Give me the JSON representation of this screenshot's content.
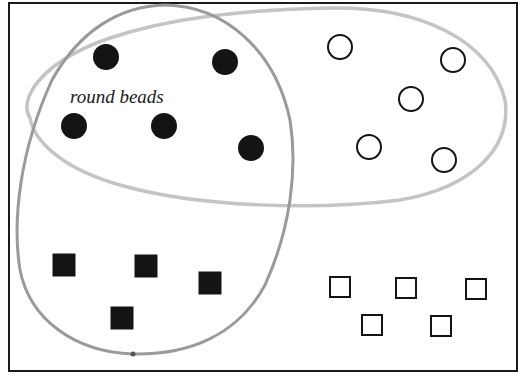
{
  "diagram": {
    "type": "venn-sorting",
    "frame": {
      "x": 9,
      "y": 3,
      "width": 508,
      "height": 368,
      "stroke": "#1a1a1a"
    },
    "label": {
      "text": "round beads",
      "x": 70,
      "y": 103,
      "font_size": 19,
      "color": "#1a1a1a"
    },
    "sets": [
      {
        "name": "round-beads-loop",
        "stroke": "#9a9a9a",
        "stroke_width": 3
      },
      {
        "name": "white-beads-loop",
        "stroke": "#c4c4c4",
        "stroke_width": 3.5
      }
    ],
    "beads": {
      "filled_circles": [
        {
          "cx": 106,
          "cy": 57
        },
        {
          "cx": 225,
          "cy": 62
        },
        {
          "cx": 74,
          "cy": 126
        },
        {
          "cx": 164,
          "cy": 126
        },
        {
          "cx": 251,
          "cy": 148
        }
      ],
      "open_circles": [
        {
          "cx": 340,
          "cy": 47
        },
        {
          "cx": 453,
          "cy": 60
        },
        {
          "cx": 411,
          "cy": 99
        },
        {
          "cx": 369,
          "cy": 147
        },
        {
          "cx": 444,
          "cy": 160
        }
      ],
      "filled_squares": [
        {
          "cx": 64,
          "cy": 265
        },
        {
          "cx": 146,
          "cy": 266
        },
        {
          "cx": 210,
          "cy": 283
        },
        {
          "cx": 122,
          "cy": 318
        }
      ],
      "open_squares": [
        {
          "cx": 340,
          "cy": 287
        },
        {
          "cx": 406,
          "cy": 288
        },
        {
          "cx": 476,
          "cy": 289
        },
        {
          "cx": 372,
          "cy": 325
        },
        {
          "cx": 441,
          "cy": 326
        }
      ],
      "circle_radius": 13,
      "filled_square_size": 23,
      "open_square_size": 20,
      "ink": "#141414"
    }
  }
}
